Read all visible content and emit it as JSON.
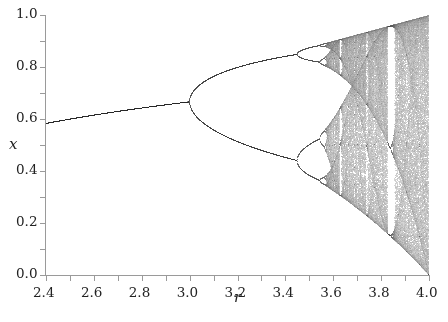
{
  "chart_data": {
    "type": "scatter",
    "title": "",
    "subtitle": "Bifurcation diagram of the logistic map x_{n+1} = r x_n (1 - x_n)",
    "xlabel": "r",
    "ylabel": "x",
    "xlim": [
      2.4,
      4.0
    ],
    "ylim": [
      0.0,
      1.0
    ],
    "x_ticks": [
      2.4,
      2.6,
      2.8,
      3.0,
      3.2,
      3.4,
      3.6,
      3.8,
      4.0
    ],
    "x_tick_labels": [
      "2.4",
      "2.6",
      "2.8",
      "3.0",
      "3.2",
      "3.4",
      "3.6",
      "3.8",
      "4.0"
    ],
    "x_minor_step": 0.1,
    "y_ticks": [
      0.0,
      0.2,
      0.4,
      0.6,
      0.8,
      1.0
    ],
    "y_tick_labels": [
      "0.0",
      "0.2",
      "0.4",
      "0.6",
      "0.8",
      "1.0"
    ],
    "y_minor_step": 0.1,
    "grid": false,
    "legend": null,
    "series": [
      {
        "name": "logistic map attractor",
        "map": "r*x*(1-x)",
        "r_range": [
          2.4,
          4.0
        ],
        "transient_iterations": 600,
        "plotted_iterations": 300,
        "point_color": "#000000"
      }
    ],
    "key_points": [
      {
        "r": 2.4,
        "x": 0.583,
        "note": "stable fixed point 1-1/r"
      },
      {
        "r": 3.0,
        "x": 0.667,
        "note": "first period-doubling bifurcation"
      },
      {
        "r": 3.449,
        "x": [
          0.44,
          0.85
        ],
        "note": "period-4 onset"
      },
      {
        "r": 3.57,
        "note": "onset of chaos"
      },
      {
        "r": 3.83,
        "note": "period-3 window"
      },
      {
        "r": 4.0,
        "x": [
          0.0,
          1.0
        ],
        "note": "full chaos"
      }
    ],
    "colors": {
      "axis": "#9a9a9a",
      "text": "#222222",
      "background": "#ffffff"
    }
  }
}
